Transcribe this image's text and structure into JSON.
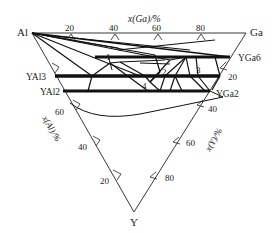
{
  "diagram": {
    "type": "ternary phase diagram",
    "vertices": {
      "top_left": "Al",
      "top_right": "Ga",
      "bottom": "Y"
    },
    "axes": {
      "top": {
        "label": "x(Ga)/%",
        "ticks": [
          "20",
          "40",
          "60",
          "80"
        ]
      },
      "left": {
        "label": "x(Al)/%",
        "ticks": [
          "60",
          "40",
          "20"
        ]
      },
      "right": {
        "label": "x(Y)/%",
        "ticks": [
          "20",
          "40",
          "60",
          "80"
        ]
      }
    },
    "phases": {
      "yal3": "YAl3",
      "yal2": "YAl2",
      "yga6": "YGa6",
      "yga2": "YGa2"
    },
    "region_labels": [
      "1",
      "2",
      "3",
      "4"
    ]
  }
}
